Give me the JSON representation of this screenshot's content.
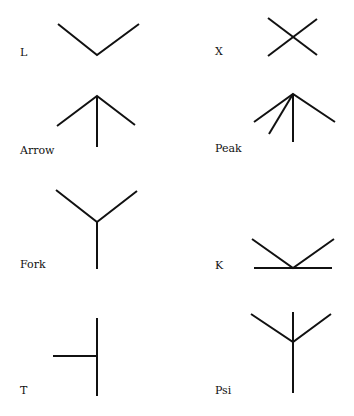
{
  "junctions": [
    {
      "label": "L",
      "x": 20,
      "y": 47
    },
    {
      "label": "X",
      "x": 215,
      "y": 46
    },
    {
      "label": "Arrow",
      "x": 20,
      "y": 145
    },
    {
      "label": "Peak",
      "x": 215,
      "y": 143
    },
    {
      "label": "Fork",
      "x": 20,
      "y": 259
    },
    {
      "label": "K",
      "x": 215,
      "y": 260
    },
    {
      "label": "T",
      "x": 20,
      "y": 385
    },
    {
      "label": "Psi",
      "x": 215,
      "y": 385
    }
  ]
}
